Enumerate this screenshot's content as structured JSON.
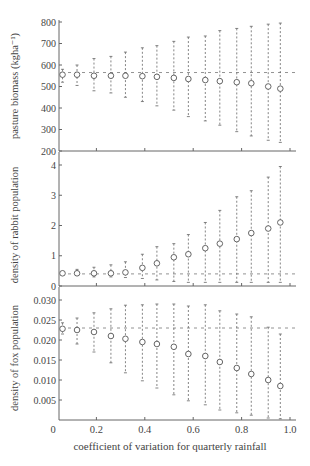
{
  "figure": {
    "xlabel": "coefficient of variation for quarterly rainfall",
    "x_ticks": [
      "0",
      "0.2",
      "0.4",
      "0.6",
      "0.8",
      "1.0"
    ]
  },
  "chart_data": [
    {
      "type": "scatter",
      "title": "",
      "ylabel": "pasture biomass (kgha⁻¹)",
      "xlabel": "coefficient of variation for quarterly rainfall",
      "ylim": [
        200,
        800
      ],
      "xlim": [
        0,
        1.0
      ],
      "y_ticks": [
        "200",
        "300",
        "400",
        "500",
        "600",
        "700",
        "800"
      ],
      "reference_line": 565,
      "grid": false,
      "series": [
        {
          "name": "mean with range",
          "x": [
            0.06,
            0.12,
            0.19,
            0.26,
            0.32,
            0.39,
            0.45,
            0.52,
            0.58,
            0.65,
            0.71,
            0.78,
            0.84,
            0.91,
            0.96
          ],
          "y": [
            555,
            555,
            550,
            550,
            550,
            548,
            545,
            540,
            535,
            530,
            525,
            520,
            515,
            500,
            490
          ],
          "upper": [
            580,
            600,
            630,
            640,
            660,
            680,
            690,
            710,
            730,
            735,
            760,
            770,
            780,
            790,
            795
          ],
          "lower": [
            520,
            505,
            480,
            470,
            450,
            430,
            410,
            390,
            360,
            340,
            320,
            290,
            270,
            250,
            240
          ]
        }
      ]
    },
    {
      "type": "scatter",
      "title": "",
      "ylabel": "density of rabbit population",
      "xlabel": "coefficient of variation for quarterly rainfall",
      "ylim": [
        0,
        4.2
      ],
      "xlim": [
        0,
        1.0
      ],
      "y_ticks": [
        "0",
        "1",
        "2",
        "3",
        "4"
      ],
      "reference_line": 0.4,
      "grid": false,
      "series": [
        {
          "name": "mean with range",
          "x": [
            0.06,
            0.12,
            0.19,
            0.26,
            0.32,
            0.39,
            0.45,
            0.52,
            0.58,
            0.65,
            0.71,
            0.78,
            0.84,
            0.91,
            0.96
          ],
          "y": [
            0.42,
            0.42,
            0.42,
            0.42,
            0.45,
            0.6,
            0.75,
            0.95,
            1.05,
            1.25,
            1.4,
            1.55,
            1.75,
            1.9,
            2.1
          ],
          "upper": [
            0.45,
            0.55,
            0.62,
            0.7,
            0.8,
            1.05,
            1.3,
            1.4,
            1.7,
            2.1,
            2.5,
            2.95,
            3.15,
            3.6,
            3.95
          ],
          "lower": [
            0.4,
            0.35,
            0.3,
            0.3,
            0.28,
            0.25,
            0.2,
            0.15,
            0.12,
            0.12,
            0.12,
            0.12,
            0.12,
            0.12,
            0.12
          ]
        }
      ]
    },
    {
      "type": "scatter",
      "title": "",
      "ylabel": "density of fox population",
      "xlabel": "coefficient of variation for quarterly rainfall",
      "ylim": [
        0,
        0.03
      ],
      "xlim": [
        0,
        1.0
      ],
      "y_ticks": [
        "0.005",
        "0.010",
        "0.015",
        "0.020",
        "0.025",
        "0.030"
      ],
      "reference_line": 0.023,
      "grid": false,
      "series": [
        {
          "name": "mean with range",
          "x": [
            0.06,
            0.12,
            0.19,
            0.26,
            0.32,
            0.39,
            0.45,
            0.52,
            0.58,
            0.65,
            0.71,
            0.78,
            0.84,
            0.91,
            0.96
          ],
          "y": [
            0.0228,
            0.0225,
            0.022,
            0.021,
            0.0203,
            0.0195,
            0.019,
            0.0183,
            0.0165,
            0.016,
            0.0145,
            0.013,
            0.0115,
            0.01,
            0.0085
          ],
          "upper": [
            0.0243,
            0.0255,
            0.0268,
            0.0278,
            0.0287,
            0.0288,
            0.029,
            0.029,
            0.0285,
            0.0288,
            0.0273,
            0.0265,
            0.0258,
            0.0232,
            0.0215
          ],
          "lower": [
            0.0215,
            0.019,
            0.017,
            0.0143,
            0.0118,
            0.0098,
            0.008,
            0.0063,
            0.0048,
            0.0038,
            0.0025,
            0.0018,
            0.0012,
            0.0005,
            0.0003
          ]
        }
      ]
    }
  ]
}
